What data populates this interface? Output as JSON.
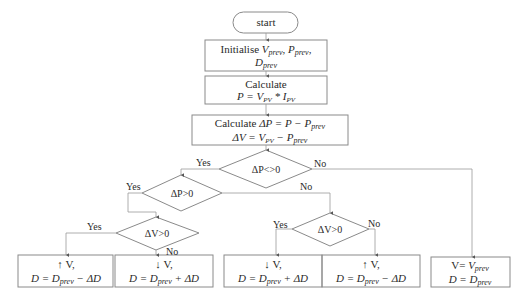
{
  "flowchart": {
    "start": "start",
    "init": {
      "line1_prefix": "Initialise ",
      "v": "V",
      "v_sub": "prev",
      "p": "P",
      "p_sub": "prev",
      "d": "D",
      "d_sub": "prev",
      "sep": ", "
    },
    "calc_power": {
      "line1": "Calculate",
      "lhs": "P = ",
      "v": "V",
      "v_sub": "PV",
      "op": " * ",
      "i": "I",
      "i_sub": "PV"
    },
    "calc_delta": {
      "line1_prefix": "Calculate ",
      "dp_lhs": "ΔP = P − ",
      "p": "P",
      "p_sub": "prev",
      "dv_lhs": "ΔV = ",
      "v": "V",
      "v_sub": "PV",
      "minus": " − ",
      "p2": "P",
      "p2_sub": "prev"
    },
    "decisions": {
      "dp_nonzero": "ΔP<>0",
      "dp_positive": "ΔP>0",
      "dv_positive_left": "ΔV>0",
      "dv_positive_right": "ΔV>0"
    },
    "labels": {
      "yes": "Yes",
      "no": "No"
    },
    "outcomes": [
      {
        "line1": "↑ V,",
        "lhs": "D = ",
        "d": "D",
        "sub": "prev",
        "rhs": " − ΔD"
      },
      {
        "line1": "↓ V,",
        "lhs": "D = ",
        "d": "D",
        "sub": "prev",
        "rhs": " + ΔD"
      },
      {
        "line1": "↓ V,",
        "lhs": "D = ",
        "d": "D",
        "sub": "prev",
        "rhs": " + ΔD"
      },
      {
        "line1": "↑ V,",
        "lhs": "D = ",
        "d": "D",
        "sub": "prev",
        "rhs": " − ΔD"
      },
      {
        "line1_prefix": "V= ",
        "v": "V",
        "v_sub": "prev",
        "lhs": "D = ",
        "d": "D",
        "sub": "prev",
        "rhs": ""
      }
    ],
    "colors": {
      "stroke": "#7a7a7a",
      "text": "#2a2a2a",
      "background": "#ffffff"
    }
  }
}
